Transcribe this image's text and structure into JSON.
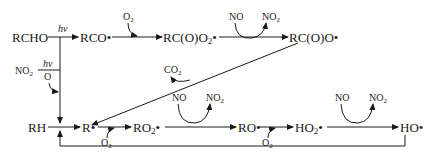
{
  "diagram": {
    "type": "chemical-reaction-scheme",
    "top_row": {
      "species": [
        "RCHO",
        "RCO•",
        "RC(O)O₂•",
        "RC(O)O•"
      ],
      "arrow_labels": {
        "rcho_to_rco": "hν",
        "rco_to_rcoo2_reactant": "O₂",
        "rcoo2_to_rcoo_reactant": "NO",
        "rcoo2_to_rcoo_product": "NO₂"
      }
    },
    "side_input": {
      "species": "NO₂",
      "above": "hν",
      "below": "O"
    },
    "decarboxylation": {
      "from": "RC(O)O•",
      "to": "R•",
      "byproduct": "CO₂"
    },
    "bottom_row": {
      "species": [
        "RH",
        "R•",
        "RO₂•",
        "RO•",
        "HO₂•",
        "HO•"
      ],
      "arrow_labels": {
        "r_to_ro2": "O₂",
        "ro2_to_ro_reactant": "NO",
        "ro2_to_ro_product": "NO₂",
        "ro_to_ho2": "O₂",
        "ho2_to_ho_reactant": "NO",
        "ho2_to_ho_product": "NO₂"
      }
    },
    "feedback_loop": {
      "from": "HO•",
      "to": "RH/R• junction"
    }
  },
  "labels": {
    "rcho": "RCHO",
    "hv": "hν",
    "rco": "RCO•",
    "o2": "O",
    "two": "2",
    "rcoo2_main": "RC(O)O",
    "dot": "•",
    "no": "NO",
    "rcoo": "RC(O)O•",
    "co": "CO",
    "rh": "RH",
    "r": "R•",
    "ro2_main": "RO",
    "ro": "RO•",
    "ho2_main": "HO",
    "ho": "HO•",
    "o_letter": "O",
    "no2_main": "NO"
  }
}
